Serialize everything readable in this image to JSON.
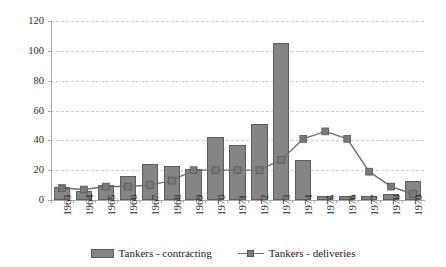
{
  "chart_data": {
    "type": "bar",
    "title": "",
    "xlabel": "",
    "ylabel": "",
    "ylim": [
      0,
      120
    ],
    "yticks": [
      0,
      20,
      40,
      60,
      80,
      100,
      120
    ],
    "grid": true,
    "legend_position": "bottom",
    "categories": [
      "1963",
      "1964",
      "1965",
      "1966",
      "1967",
      "1968",
      "1969",
      "1970",
      "1971",
      "1972",
      "1973",
      "1974",
      "1975",
      "1976",
      "1977",
      "1978",
      "1979"
    ],
    "series": [
      {
        "name": "Tankers - contracting",
        "type": "bar",
        "color": "#858585",
        "values": [
          9,
          6,
          10,
          16,
          24,
          23,
          21,
          42,
          37,
          51,
          105,
          27,
          3,
          3,
          3,
          4,
          13
        ]
      },
      {
        "name": "Tankers - deliveries",
        "type": "line",
        "color": "#6e6e6e",
        "marker": "square",
        "values": [
          8,
          7,
          9,
          9,
          10,
          13,
          20,
          20,
          20,
          20,
          27,
          41,
          46,
          41,
          19,
          9,
          4
        ]
      }
    ]
  },
  "legend": {
    "items": [
      {
        "label": "Tankers - contracting",
        "swatch": "bar-swatch"
      },
      {
        "label": "Tankers - deliveries",
        "swatch": "line-swatch"
      }
    ]
  },
  "axis": {
    "y_tick_labels": [
      "120",
      "100",
      "80",
      "60",
      "40",
      "20",
      "0"
    ]
  }
}
